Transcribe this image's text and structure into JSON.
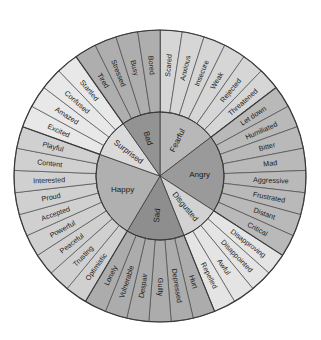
{
  "geometry": {
    "cx": 160,
    "cy": 176,
    "r_outer": 146,
    "r_inner": 64
  },
  "colors": {
    "stroke": "#3a3a3a",
    "background": "#ffffff"
  },
  "categories": [
    {
      "name": "Fearful",
      "inner_fill": "#b8b8b8",
      "outer_fill": "#d6d6d6",
      "feelings": [
        "Scared",
        "Anxious",
        "Insecure",
        "Weak",
        "Rejected",
        "Threatened"
      ]
    },
    {
      "name": "Angry",
      "inner_fill": "#9a9a9a",
      "outer_fill": "#b9b9b9",
      "feelings": [
        "Let down",
        "Humiliated",
        "Bitter",
        "Mad",
        "Aggressive",
        "Frustrated",
        "Distant",
        "Critical"
      ]
    },
    {
      "name": "Disgusted",
      "inner_fill": "#d2d2d2",
      "outer_fill": "#e4e4e4",
      "feelings": [
        "Disapproving",
        "Disappointed",
        "Awful",
        "Repelled"
      ]
    },
    {
      "name": "Sad",
      "inner_fill": "#8e8e8e",
      "outer_fill": "#acacac",
      "feelings": [
        "Hurt",
        "Depressed",
        "Guilty",
        "Despair",
        "Vulnerable",
        "Lonely"
      ]
    },
    {
      "name": "Happy",
      "inner_fill": "#b0b0b0",
      "outer_fill": "#d0d0d0",
      "feelings": [
        "Optimistic",
        "Trusting",
        "Peaceful",
        "Powerful",
        "Accepted",
        "Proud",
        "Interested",
        "Content",
        "Playful"
      ]
    },
    {
      "name": "Surprised",
      "inner_fill": "#dadada",
      "outer_fill": "#e8e8e8",
      "feelings": [
        "Excited",
        "Amazed",
        "Confused",
        "Startled"
      ]
    },
    {
      "name": "Bad",
      "inner_fill": "#939393",
      "outer_fill": "#aeaeae",
      "feelings": [
        "Tired",
        "Stressed",
        "Busy",
        "Bored"
      ]
    }
  ]
}
